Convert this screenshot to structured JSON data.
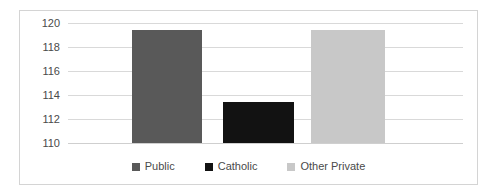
{
  "chart_data": {
    "type": "bar",
    "title": "",
    "subtitle": "",
    "xlabel": "",
    "ylabel": "",
    "categories": [
      "Public",
      "Catholic",
      "Other Private"
    ],
    "values": [
      119.4,
      113.4,
      119.4
    ],
    "series": [
      {
        "name": "Scores by school type",
        "values": [
          119.4,
          113.4,
          119.4
        ]
      }
    ],
    "ylim": [
      110,
      120
    ],
    "ytick_labels": [
      "120",
      "118",
      "116",
      "114",
      "112",
      "110"
    ],
    "yticks": [
      120,
      118,
      116,
      114,
      112,
      110
    ],
    "grid": true,
    "legend_position": "bottom",
    "colors": {
      "public": "#595959",
      "catholic": "#121212",
      "other_private": "#c8c8c8",
      "gridline": "#d9d9d9",
      "border": "#d4d4d4",
      "text": "#4a4a4a",
      "background": "#ffffff"
    }
  },
  "legend": {
    "items": [
      {
        "label": "Public",
        "color": "#595959"
      },
      {
        "label": "Catholic",
        "color": "#121212"
      },
      {
        "label": "Other Private",
        "color": "#c8c8c8"
      }
    ]
  }
}
